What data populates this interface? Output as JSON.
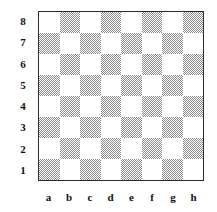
{
  "diagram": {
    "type": "chessboard",
    "board": {
      "ranks": 8,
      "files": 8,
      "orientation": "white-bottom",
      "light_square_color": "#ffffff",
      "dark_square_color": "#8f8f8f",
      "border_color": "#2b2b2b",
      "background_color": "#ffffff",
      "dark_square_fill_style": "diagonal-halftone-hatch",
      "top_left_square_shade": "light",
      "bottom_left_square_shade": "dark",
      "pieces": [],
      "shades": [
        [
          "light",
          "dark",
          "light",
          "dark",
          "light",
          "dark",
          "light",
          "dark"
        ],
        [
          "dark",
          "light",
          "dark",
          "light",
          "dark",
          "light",
          "dark",
          "light"
        ],
        [
          "light",
          "dark",
          "light",
          "dark",
          "light",
          "dark",
          "light",
          "dark"
        ],
        [
          "dark",
          "light",
          "dark",
          "light",
          "dark",
          "light",
          "dark",
          "light"
        ],
        [
          "light",
          "dark",
          "light",
          "dark",
          "light",
          "dark",
          "light",
          "dark"
        ],
        [
          "dark",
          "light",
          "dark",
          "light",
          "dark",
          "light",
          "dark",
          "light"
        ],
        [
          "light",
          "dark",
          "light",
          "dark",
          "light",
          "dark",
          "light",
          "dark"
        ],
        [
          "dark",
          "light",
          "dark",
          "light",
          "dark",
          "light",
          "dark",
          "light"
        ]
      ]
    },
    "rank_labels": [
      "8",
      "7",
      "6",
      "5",
      "4",
      "3",
      "2",
      "1"
    ],
    "file_labels": [
      "a",
      "b",
      "c",
      "d",
      "e",
      "f",
      "g",
      "h"
    ]
  }
}
